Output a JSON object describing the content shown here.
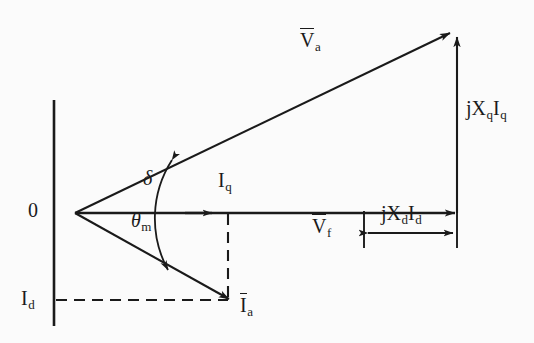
{
  "figure": {
    "type": "phasor-diagram",
    "background_color": "#fbfbfb",
    "line_color": "#1a1a1a",
    "origin_label": "0"
  },
  "labels": {
    "origin": "0",
    "va_base": "V",
    "va_sub": "a",
    "vf_base": "V",
    "vf_sub": "f",
    "ia_base": "I",
    "ia_sub": "a",
    "iq_base": "I",
    "iq_sub": "q",
    "id_base": "I",
    "id_sub": "d",
    "jxqiq_j": "j",
    "jxqiq_x": "X",
    "jxqiq_xsub": "q",
    "jxqiq_i": "I",
    "jxqiq_isub": "q",
    "jxdid_j": "j",
    "jxdid_x": "X",
    "jxdid_xsub": "d",
    "jxdid_i": "I",
    "jxdid_isub": "d",
    "delta": "δ",
    "theta_base": "θ",
    "theta_sub": "m"
  },
  "geometry": {
    "origin": {
      "x": 75,
      "y": 213
    },
    "vertical_axis": {
      "x": 54,
      "y_top": 100,
      "y_bottom": 326
    },
    "va_tip": {
      "x": 452,
      "y": 32
    },
    "q_axis_tip": {
      "x": 456,
      "y": 213
    },
    "iq_arrow_tip": {
      "x": 213,
      "y": 213
    },
    "ia_tip": {
      "x": 232,
      "y": 300
    },
    "jxq_vertical": {
      "x": 457,
      "y_top": 35,
      "y_bottom": 213
    },
    "jxd_dimension": {
      "x_start": 367,
      "x_end": 455,
      "y": 232
    },
    "id_dashed": {
      "x_start": 56,
      "x_end": 230,
      "y": 300
    },
    "iq_dashed": {
      "x": 228,
      "y_top": 214,
      "y_bottom": 298
    },
    "angle_arc_radius": 108,
    "delta_deg": 25.6,
    "theta_m_deg": 23.5
  },
  "label_positions": {
    "va": {
      "x": 300,
      "y": 36
    },
    "jxqiq": {
      "x": 466,
      "y": 107
    },
    "iq": {
      "x": 218,
      "y": 178
    },
    "vf": {
      "x": 315,
      "y": 220
    },
    "jxdid": {
      "x": 381,
      "y": 207
    },
    "delta": {
      "x": 143,
      "y": 175
    },
    "theta_m": {
      "x": 133,
      "y": 216
    },
    "origin": {
      "x": 29,
      "y": 198
    },
    "id": {
      "x": 22,
      "y": 286
    },
    "ia": {
      "x": 239,
      "y": 293
    }
  }
}
